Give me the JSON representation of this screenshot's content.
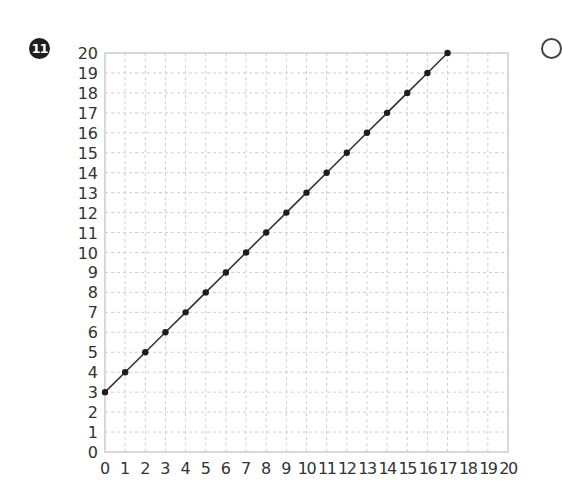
{
  "problem": {
    "number": "11"
  },
  "chart_data": {
    "type": "line",
    "title": "",
    "xlabel": "",
    "ylabel": "",
    "xlim": [
      0,
      20
    ],
    "ylim": [
      0,
      20
    ],
    "grid": true,
    "legend": null,
    "x_ticks": [
      0,
      1,
      2,
      3,
      4,
      5,
      6,
      7,
      8,
      9,
      10,
      11,
      12,
      13,
      14,
      15,
      16,
      17,
      18,
      19,
      20
    ],
    "y_ticks": [
      0,
      1,
      2,
      3,
      4,
      5,
      6,
      7,
      8,
      9,
      10,
      11,
      12,
      13,
      14,
      15,
      16,
      17,
      18,
      19,
      20
    ],
    "series": [
      {
        "name": "y = x + 3",
        "marker": "circle",
        "color": "#222222",
        "x": [
          0,
          1,
          2,
          3,
          4,
          5,
          6,
          7,
          8,
          9,
          10,
          11,
          12,
          13,
          14,
          15,
          16,
          17
        ],
        "y": [
          3,
          4,
          5,
          6,
          7,
          8,
          9,
          10,
          11,
          12,
          13,
          14,
          15,
          16,
          17,
          18,
          19,
          20
        ]
      }
    ]
  },
  "colors": {
    "grid": "#cfcfcf",
    "border": "#cccccc",
    "line": "#333333",
    "marker": "#1e1e1e",
    "text": "#333333"
  }
}
